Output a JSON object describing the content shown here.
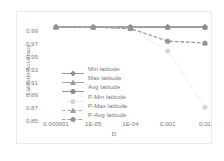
{
  "chart_data": {
    "type": "line",
    "title": "",
    "xlabel": "D",
    "ylabel": "Latitude Accuracy",
    "x": [
      1e-06,
      1e-05,
      0.0001,
      0.001,
      0.01
    ],
    "xtick_labels": [
      "0.000001",
      "1E-05",
      "1E-04",
      "0.001",
      "0.01"
    ],
    "ytick_labels": [
      "0.99",
      "0.97",
      "0.95",
      "0.93",
      "0.91",
      "0.89",
      "0.87",
      "0.85"
    ],
    "ytick_values": [
      0.99,
      0.97,
      0.95,
      0.93,
      0.91,
      0.89,
      0.87,
      0.85
    ],
    "ylim": [
      0.85,
      1.0
    ],
    "grid": false,
    "legend_position": "center-left-inside",
    "series": [
      {
        "name": "Min latitude",
        "values": [
          0.9955,
          0.9955,
          0.9955,
          0.9955,
          0.9955
        ],
        "color": "#8f8f8f",
        "marker": "diamond",
        "dash": "solid"
      },
      {
        "name": "Max latitude",
        "values": [
          0.9952,
          0.9952,
          0.9952,
          0.9952,
          0.9952
        ],
        "color": "#9a9a9a",
        "marker": "triangle",
        "dash": "solid"
      },
      {
        "name": "Avg latitude",
        "values": [
          0.995,
          0.995,
          0.995,
          0.995,
          0.995
        ],
        "color": "#8a8a8a",
        "marker": "circle",
        "dash": "solid"
      },
      {
        "name": "P-Min latitude",
        "values": [
          0.9955,
          0.995,
          0.992,
          0.958,
          0.87
        ],
        "color": "#d5d5d5",
        "marker": "circle",
        "dash": "dotted"
      },
      {
        "name": "P-Max latitude",
        "values": [
          0.9955,
          0.995,
          0.993,
          0.9735,
          0.9705
        ],
        "color": "#9e9e9e",
        "marker": "triangle",
        "dash": "dashed"
      },
      {
        "name": "P-Avg latitude",
        "values": [
          0.9955,
          0.995,
          0.9928,
          0.973,
          0.97
        ],
        "color": "#949494",
        "marker": "circle",
        "dash": "dashed"
      }
    ]
  }
}
